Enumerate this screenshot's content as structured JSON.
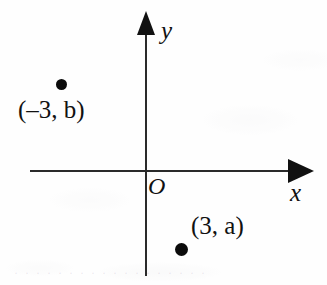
{
  "figure": {
    "kind": "cartesian-coordinate-plane-diagram",
    "background_color": "#fefefe",
    "ink_color": "#111111"
  },
  "axes": {
    "y_axis_label": "y",
    "x_axis_label": "x",
    "origin_label": "O",
    "y_arrow_direction": "up",
    "x_arrow_direction": "right"
  },
  "points": [
    {
      "id": "point-neg3-b",
      "label": "(–3, b)",
      "x_value": "–3",
      "y_value": "b",
      "quadrant": "II"
    },
    {
      "id": "point-3-a",
      "label": "(3, a)",
      "x_value": "3",
      "y_value": "a",
      "quadrant": "IV"
    }
  ],
  "artifacts": {
    "bottom_ghost_text": "· ·  · · ·   · · · ·  · ·   · · · · ·  · ·"
  }
}
